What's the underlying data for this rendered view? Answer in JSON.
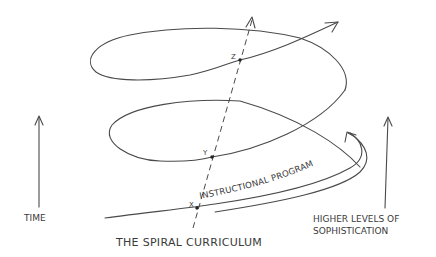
{
  "diagram": {
    "title": "THE SPIRAL CURRICULUM",
    "labels": {
      "time": "TIME",
      "sophistication_line1": "HIGHER LEVELS OF",
      "sophistication_line2": "SOPHISTICATION",
      "spiral": "INSTRUCTIONAL PROGRAM"
    },
    "points": [
      {
        "id": "x",
        "label": "X"
      },
      {
        "id": "y",
        "label": "Y"
      },
      {
        "id": "z",
        "label": "Z"
      }
    ],
    "colors": {
      "stroke": "#4a4a4a",
      "text": "#3a3a3a",
      "background": "#ffffff"
    }
  }
}
